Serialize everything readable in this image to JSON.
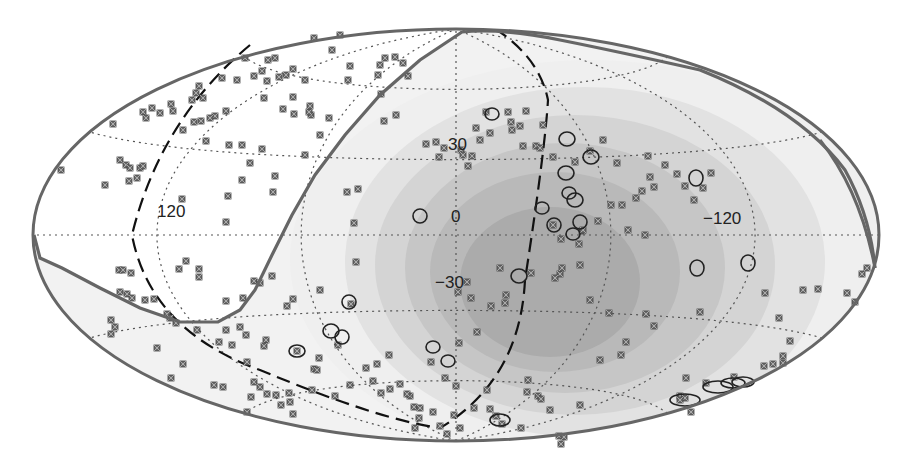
{
  "chart_data": {
    "type": "scatter",
    "title": "",
    "projection": "Hammer-Aitoff (galactic coordinates)",
    "xlabel": "Galactic longitude",
    "ylabel": "Galactic latitude",
    "longitude_tick_labels": [
      "120",
      "0",
      "-120"
    ],
    "latitude_tick_labels": [
      "30",
      "0",
      "-30"
    ],
    "grid": "dotted graticule every 60° longitude, 30° latitude",
    "background_shading": {
      "description": "Nested grey contour bands of relative exposure, darkest centered near l≈-45°, b≈-30°",
      "levels": 6,
      "colors": [
        "#efefef",
        "#e2e2e2",
        "#d4d4d4",
        "#c6c6c6",
        "#b9b9b9",
        "#ababab"
      ]
    },
    "series": [
      {
        "name": "Cosmic-ray arrival directions",
        "marker": "small-square-cross",
        "color": "#555555",
        "points_px": [
          [
            245,
            58
          ],
          [
            268,
            60
          ],
          [
            222,
            78
          ],
          [
            237,
            80
          ],
          [
            199,
            86
          ],
          [
            196,
            93
          ],
          [
            171,
            104
          ],
          [
            203,
            98
          ],
          [
            152,
            108
          ],
          [
            143,
            112
          ],
          [
            160,
            113
          ],
          [
            146,
            118
          ],
          [
            192,
            100
          ],
          [
            226,
            111
          ],
          [
            215,
            116
          ],
          [
            210,
            118
          ],
          [
            194,
            122
          ],
          [
            140,
            168
          ],
          [
            173,
            111
          ],
          [
            201,
            121
          ],
          [
            183,
            130
          ],
          [
            206,
            141
          ],
          [
            229,
            145
          ],
          [
            242,
            145
          ],
          [
            262,
            149
          ],
          [
            250,
            163
          ],
          [
            275,
            176
          ],
          [
            242,
            180
          ],
          [
            228,
            196
          ],
          [
            120,
            160
          ],
          [
            126,
            165
          ],
          [
            130,
            168
          ],
          [
            137,
            178
          ],
          [
            143,
            166
          ],
          [
            105,
            185
          ],
          [
            129,
            181
          ],
          [
            226,
            222
          ],
          [
            273,
            192
          ],
          [
            61,
            170
          ],
          [
            113,
            124
          ],
          [
            182,
            199
          ],
          [
            320,
            135
          ],
          [
            305,
            155
          ],
          [
            264,
            98
          ],
          [
            283,
            109
          ],
          [
            293,
            97
          ],
          [
            267,
            81
          ],
          [
            340,
            35
          ],
          [
            314,
            38
          ],
          [
            332,
            50
          ],
          [
            350,
            66
          ],
          [
            348,
            80
          ],
          [
            380,
            65
          ],
          [
            385,
            58
          ],
          [
            395,
            57
          ],
          [
            403,
            63
          ],
          [
            378,
            75
          ],
          [
            408,
            76
          ],
          [
            381,
            94
          ],
          [
            396,
            115
          ],
          [
            347,
            192
          ],
          [
            358,
            189
          ],
          [
            354,
            223
          ],
          [
            384,
            121
          ],
          [
            329,
            118
          ],
          [
            311,
            115
          ],
          [
            294,
            114
          ],
          [
            309,
            112
          ],
          [
            275,
            58
          ],
          [
            262,
            71
          ],
          [
            254,
            76
          ],
          [
            279,
            77
          ],
          [
            293,
            69
          ],
          [
            305,
            80
          ],
          [
            310,
            106
          ],
          [
            286,
            75
          ],
          [
            426,
            144
          ],
          [
            436,
            142
          ],
          [
            444,
            148
          ],
          [
            439,
            157
          ],
          [
            461,
            150
          ],
          [
            463,
            155
          ],
          [
            472,
            156
          ],
          [
            468,
            166
          ],
          [
            480,
            140
          ],
          [
            490,
            133
          ],
          [
            476,
            128
          ],
          [
            486,
            112
          ],
          [
            508,
            112
          ],
          [
            526,
            111
          ],
          [
            543,
            125
          ],
          [
            511,
            122
          ],
          [
            512,
            130
          ],
          [
            520,
            126
          ],
          [
            523,
            146
          ],
          [
            536,
            146
          ],
          [
            540,
            148
          ],
          [
            553,
            157
          ],
          [
            575,
            162
          ],
          [
            590,
            151
          ],
          [
            603,
            140
          ],
          [
            617,
            163
          ],
          [
            648,
            156
          ],
          [
            665,
            165
          ],
          [
            650,
            177
          ],
          [
            654,
            187
          ],
          [
            642,
            191
          ],
          [
            677,
            174
          ],
          [
            685,
            186
          ],
          [
            703,
            188
          ],
          [
            711,
            173
          ],
          [
            694,
            200
          ],
          [
            636,
            198
          ],
          [
            622,
            205
          ],
          [
            611,
            205
          ],
          [
            628,
            230
          ],
          [
            645,
            235
          ],
          [
            598,
            221
          ],
          [
            582,
            231
          ],
          [
            579,
            244
          ],
          [
            561,
            239
          ],
          [
            583,
            230
          ],
          [
            553,
            225
          ],
          [
            580,
            265
          ],
          [
            500,
            268
          ],
          [
            531,
            273
          ],
          [
            560,
            274
          ],
          [
            562,
            268
          ],
          [
            555,
            278
          ],
          [
            590,
            300
          ],
          [
            626,
            342
          ],
          [
            600,
            360
          ],
          [
            609,
            313
          ],
          [
            646,
            314
          ],
          [
            654,
            326
          ],
          [
            700,
            312
          ],
          [
            765,
            293
          ],
          [
            779,
            318
          ],
          [
            803,
            290
          ],
          [
            790,
            341
          ],
          [
            847,
            293
          ],
          [
            855,
            302
          ],
          [
            862,
            274
          ],
          [
            867,
            268
          ],
          [
            818,
            289
          ],
          [
            734,
            377
          ],
          [
            773,
            364
          ],
          [
            783,
            356
          ],
          [
            764,
            366
          ],
          [
            783,
            363
          ],
          [
            686,
            378
          ],
          [
            680,
            396
          ],
          [
            685,
            398
          ],
          [
            691,
            412
          ],
          [
            706,
            383
          ],
          [
            680,
            400
          ],
          [
            621,
            355
          ],
          [
            506,
            295
          ],
          [
            505,
            303
          ],
          [
            458,
            292
          ],
          [
            467,
            282
          ],
          [
            471,
            298
          ],
          [
            491,
            306
          ],
          [
            477,
            332
          ],
          [
            459,
            343
          ],
          [
            431,
            362
          ],
          [
            445,
            378
          ],
          [
            456,
            386
          ],
          [
            487,
            390
          ],
          [
            474,
            408
          ],
          [
            496,
            416
          ],
          [
            502,
            424
          ],
          [
            527,
            392
          ],
          [
            538,
            396
          ],
          [
            528,
            380
          ],
          [
            580,
            405
          ],
          [
            454,
            415
          ],
          [
            460,
            428
          ],
          [
            490,
            409
          ],
          [
            521,
            428
          ],
          [
            356,
            262
          ],
          [
            351,
            304
          ],
          [
            338,
            345
          ],
          [
            366,
            368
          ],
          [
            377,
            364
          ],
          [
            389,
            355
          ],
          [
            410,
            396
          ],
          [
            320,
            290
          ],
          [
            293,
            299
          ],
          [
            287,
            306
          ],
          [
            266,
            340
          ],
          [
            232,
            345
          ],
          [
            219,
            342
          ],
          [
            154,
            299
          ],
          [
            167,
            314
          ],
          [
            183,
            364
          ],
          [
            171,
            378
          ],
          [
            214,
            385
          ],
          [
            223,
            387
          ],
          [
            197,
            330
          ],
          [
            254,
            382
          ],
          [
            260,
            387
          ],
          [
            267,
            394
          ],
          [
            251,
            397
          ],
          [
            247,
            412
          ],
          [
            276,
            395
          ],
          [
            289,
            393
          ],
          [
            290,
            402
          ],
          [
            281,
            405
          ],
          [
            293,
            414
          ],
          [
            312,
            390
          ],
          [
            247,
            362
          ],
          [
            240,
            327
          ],
          [
            226,
            330
          ],
          [
            157,
            348
          ],
          [
            120,
            292
          ],
          [
            127,
            294
          ],
          [
            132,
            298
          ],
          [
            145,
            300
          ],
          [
            119,
            270
          ],
          [
            131,
            273
          ],
          [
            123,
            270
          ],
          [
            186,
            261
          ],
          [
            179,
            269
          ],
          [
            199,
            269
          ],
          [
            199,
            277
          ],
          [
            170,
            318
          ],
          [
            176,
            323
          ],
          [
            111,
            334
          ],
          [
            111,
            320
          ],
          [
            115,
            327
          ],
          [
            264,
            346
          ],
          [
            246,
            335
          ],
          [
            226,
            301
          ],
          [
            254,
            281
          ],
          [
            260,
            283
          ],
          [
            272,
            276
          ],
          [
            243,
            298
          ],
          [
            297,
            351
          ],
          [
            319,
            358
          ],
          [
            314,
            369
          ],
          [
            317,
            370
          ],
          [
            335,
            396
          ],
          [
            350,
            385
          ],
          [
            373,
            381
          ],
          [
            381,
            393
          ],
          [
            390,
            389
          ],
          [
            400,
            384
          ],
          [
            407,
            394
          ],
          [
            414,
            407
          ],
          [
            420,
            408
          ],
          [
            419,
            418
          ],
          [
            433,
            412
          ],
          [
            440,
            426
          ],
          [
            447,
            434
          ],
          [
            415,
            428
          ],
          [
            541,
            399
          ],
          [
            550,
            410
          ],
          [
            559,
            436
          ],
          [
            564,
            437
          ],
          [
            561,
            444
          ]
        ]
      },
      {
        "name": "Nearby AGN / sources (circles)",
        "marker": "open-ellipse",
        "color": "#222222",
        "points_px": [
          [
            492,
            114,
            7,
            6
          ],
          [
            567,
            139,
            8,
            7
          ],
          [
            591,
            157,
            8,
            7
          ],
          [
            566,
            173,
            8,
            7
          ],
          [
            569,
            193,
            7,
            6
          ],
          [
            575,
            200,
            8,
            7
          ],
          [
            580,
            222,
            7,
            7
          ],
          [
            573,
            234,
            7,
            6
          ],
          [
            554,
            225,
            7,
            7
          ],
          [
            542,
            208,
            7,
            6
          ],
          [
            420,
            216,
            7,
            7
          ],
          [
            519,
            276,
            8,
            7
          ],
          [
            349,
            302,
            7,
            7
          ],
          [
            331,
            331,
            8,
            7
          ],
          [
            342,
            337,
            7,
            7
          ],
          [
            297,
            351,
            8,
            6
          ],
          [
            433,
            347,
            7,
            6
          ],
          [
            448,
            361,
            7,
            6
          ],
          [
            696,
            178,
            7,
            8
          ],
          [
            748,
            263,
            7,
            8
          ],
          [
            697,
            268,
            7,
            8
          ],
          [
            500,
            420,
            10,
            6
          ],
          [
            685,
            400,
            15,
            6
          ],
          [
            718,
            387,
            15,
            6
          ],
          [
            733,
            383,
            12,
            5
          ],
          [
            743,
            382,
            11,
            5
          ]
        ]
      }
    ],
    "overlays": [
      {
        "name": "Field-of-view boundary",
        "style": "solid thick grey #666666"
      },
      {
        "name": "Supergalactic plane",
        "style": "black dashed"
      }
    ],
    "axis_ranges": {
      "longitude": [
        180,
        -180
      ],
      "latitude": [
        -90,
        90
      ]
    },
    "legend": "none"
  },
  "labels": {
    "lon_120": "120",
    "lon_0": "0",
    "lon_m120": "−120",
    "lat_30": "30",
    "lat_m30": "−30"
  },
  "style": {
    "outline": "#666666",
    "grid": "#555555",
    "marker_fill": "#6b6b6b",
    "marker_edge": "#444444",
    "circle": "#222222",
    "dashed": "#111111"
  }
}
